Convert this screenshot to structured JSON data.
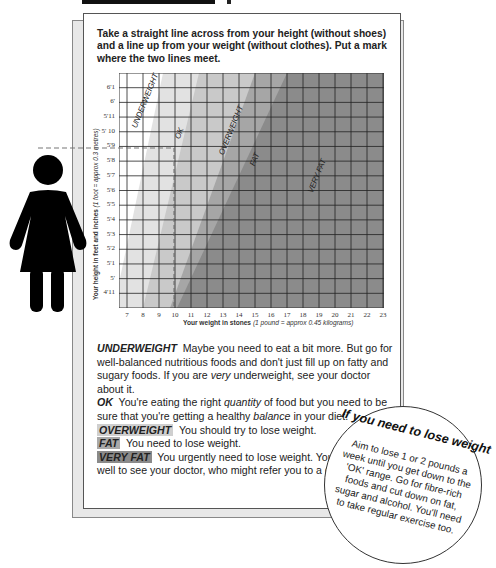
{
  "header": {
    "instructions": "Take a straight line across from your height (without shoes) and a line up from your weight (without clothes). Put a mark where the two lines meet."
  },
  "chart_data": {
    "type": "heatmap",
    "xlabel": "Your weight in stones",
    "xlabel_note": "(1 pound = approx 0.45 kilograms)",
    "ylabel": "Your height in feet and inches",
    "ylabel_note": "(1 foot = approx 0.3 metres)",
    "x_ticks": [
      "7",
      "8",
      "9",
      "10",
      "11",
      "12",
      "13",
      "14",
      "15",
      "16",
      "17",
      "18",
      "19",
      "20",
      "21",
      "22",
      "23"
    ],
    "y_ticks": [
      "6'1",
      "6'",
      "5'11",
      "5' 10",
      "5'9",
      "5'8",
      "5'7",
      "5'6",
      "5'5",
      "5'4",
      "5'3",
      "5'2",
      "5'1",
      "5'",
      "4'11"
    ],
    "xlim": [
      6.5,
      23
    ],
    "ylim": [
      "4'10",
      "6'2"
    ],
    "zones": [
      {
        "name": "UNDERWEIGHT",
        "color": "#ffffff"
      },
      {
        "name": "OK",
        "color": "#e2e2e2"
      },
      {
        "name": "OVERWEIGHT",
        "color": "#c9c9c9"
      },
      {
        "name": "FAT",
        "color": "#a6a6a6"
      },
      {
        "name": "VERY FAT",
        "color": "#8b8b8b"
      }
    ],
    "zone_boundaries_approx": [
      {
        "between": "UNDERWEIGHT/OK",
        "at_4ft11_stone": 6.7,
        "at_6ft2_stone": 9.2
      },
      {
        "between": "OK/OVERWEIGHT",
        "at_4ft11_stone": 8.0,
        "at_6ft2_stone": 11.5
      },
      {
        "between": "OVERWEIGHT/FAT",
        "at_4ft11_stone": 9.7,
        "at_6ft2_stone": 15.0
      },
      {
        "between": "FAT/VERY FAT",
        "at_4ft11_stone": 10.1,
        "at_6ft2_stone": 17.0
      }
    ],
    "example_marker": {
      "height": "5'8.7",
      "weight_stone": 9.5
    },
    "grid": true
  },
  "legend": {
    "underweight": {
      "tag": "UNDERWEIGHT",
      "text": "Maybe you need to eat a bit more. But go for well-balanced nutritious foods and don't just fill up on fatty and sugary foods. If you are ",
      "em": "very",
      "text2": " underweight, see your doctor about it."
    },
    "ok": {
      "tag": "OK",
      "text": "You're eating the right ",
      "em": "quantity",
      "text2": " of food but you need to be sure that you're getting a healthy ",
      "em2": "balance",
      "text3": " in your diet."
    },
    "overweight": {
      "tag": "OVERWEIGHT",
      "text": "You should try to lose weight."
    },
    "fat": {
      "tag": "FAT",
      "text": "You need to lose weight."
    },
    "very_fat": {
      "tag": "VERY FAT",
      "text": "You urgently need to lose weight. You would do well to see your doctor, who might refer you to a dietitian."
    }
  },
  "callout": {
    "title": "If you need to lose weight",
    "body": "Aim to lose 1 or 2 pounds a week until you get down to the 'OK' range. Go for fibre-rich foods and cut down on fat, sugar and alcohol. You'll need to take regular exercise too."
  },
  "icons": {
    "figure": "woman-silhouette-icon"
  }
}
